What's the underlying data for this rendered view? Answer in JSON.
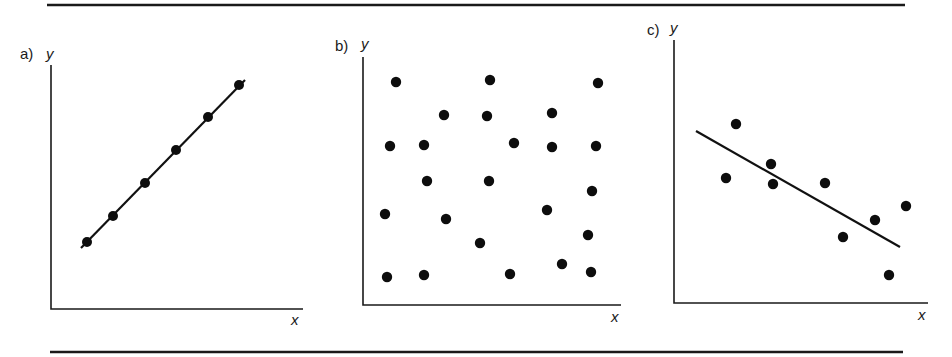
{
  "chart_data": [
    {
      "type": "scatter",
      "panel_label": "a)",
      "xlabel": "x",
      "ylabel": "y",
      "description": "perfect positive linear correlation",
      "points": [
        [
          1,
          1
        ],
        [
          2,
          2
        ],
        [
          3,
          3
        ],
        [
          4,
          4
        ],
        [
          5,
          5
        ],
        [
          6,
          6
        ]
      ],
      "fit_line": {
        "from": [
          0.8,
          0.8
        ],
        "to": [
          6.2,
          6.2
        ]
      },
      "grid": false,
      "ticks": false
    },
    {
      "type": "scatter",
      "panel_label": "b)",
      "xlabel": "x",
      "ylabel": "y",
      "description": "no correlation (random scatter)",
      "points": [
        [
          1.3,
          8.7
        ],
        [
          5.0,
          8.8
        ],
        [
          9.3,
          8.6
        ],
        [
          3.2,
          7.4
        ],
        [
          4.9,
          7.3
        ],
        [
          7.5,
          7.5
        ],
        [
          1.1,
          6.2
        ],
        [
          2.4,
          6.2
        ],
        [
          6.0,
          6.3
        ],
        [
          7.5,
          6.1
        ],
        [
          9.2,
          6.2
        ],
        [
          2.5,
          4.8
        ],
        [
          5.0,
          4.8
        ],
        [
          9.1,
          4.4
        ],
        [
          0.9,
          3.5
        ],
        [
          3.3,
          3.3
        ],
        [
          7.3,
          3.7
        ],
        [
          4.6,
          2.5
        ],
        [
          8.9,
          2.8
        ],
        [
          1.0,
          1.0
        ],
        [
          2.4,
          1.1
        ],
        [
          5.8,
          1.1
        ],
        [
          7.9,
          1.5
        ],
        [
          9.0,
          1.2
        ]
      ],
      "fit_line": null,
      "grid": false,
      "ticks": false
    },
    {
      "type": "scatter",
      "panel_label": "c)",
      "xlabel": "x",
      "ylabel": "y",
      "description": "moderate negative correlation with fitted line",
      "points": [
        [
          2.4,
          6.9
        ],
        [
          2.0,
          4.8
        ],
        [
          3.8,
          5.4
        ],
        [
          3.9,
          4.6
        ],
        [
          5.9,
          4.7
        ],
        [
          6.6,
          2.6
        ],
        [
          7.9,
          3.3
        ],
        [
          9.1,
          3.8
        ],
        [
          8.4,
          1.1
        ]
      ],
      "fit_line": {
        "from": [
          0.9,
          6.6
        ],
        "to": [
          8.9,
          2.1
        ]
      },
      "grid": false,
      "ticks": false
    }
  ],
  "figure": {
    "panels": [
      {
        "id": "a",
        "label": "a)",
        "ylabel": "y",
        "xlabel": "x",
        "axis": {
          "x0": 51,
          "y0": 309,
          "x1": 303,
          "ytop": 65
        },
        "label_pos": {
          "lx": 20,
          "ly": 59,
          "yx": 46,
          "yy": 59,
          "xx": 291,
          "xy": 325
        },
        "pixel_points": [
          [
            87,
            242
          ],
          [
            113,
            216
          ],
          [
            145,
            183
          ],
          [
            176,
            150
          ],
          [
            208,
            117
          ],
          [
            239,
            85
          ]
        ],
        "pixel_line": [
          81,
          248,
          245,
          80
        ]
      },
      {
        "id": "b",
        "label": "b)",
        "ylabel": "y",
        "xlabel": "x",
        "axis": {
          "x0": 363,
          "y0": 305,
          "x1": 621,
          "ytop": 57
        },
        "label_pos": {
          "lx": 335,
          "ly": 51,
          "yx": 361,
          "yy": 49,
          "xx": 611,
          "xy": 322
        },
        "pixel_points": [
          [
            396,
            82
          ],
          [
            490,
            80
          ],
          [
            598,
            83
          ],
          [
            444,
            115
          ],
          [
            487,
            116
          ],
          [
            552,
            113
          ],
          [
            390,
            146
          ],
          [
            424,
            145
          ],
          [
            514,
            143
          ],
          [
            552,
            147
          ],
          [
            596,
            146
          ],
          [
            427,
            181
          ],
          [
            489,
            181
          ],
          [
            592,
            191
          ],
          [
            385,
            214
          ],
          [
            446,
            219
          ],
          [
            547,
            210
          ],
          [
            480,
            243
          ],
          [
            588,
            235
          ],
          [
            387,
            277
          ],
          [
            424,
            275
          ],
          [
            510,
            274
          ],
          [
            562,
            264
          ],
          [
            591,
            272
          ]
        ],
        "pixel_line": null
      },
      {
        "id": "c",
        "label": "c)",
        "ylabel": "y",
        "xlabel": "x",
        "axis": {
          "x0": 674,
          "y0": 303,
          "x1": 928,
          "ytop": 40
        },
        "label_pos": {
          "lx": 647,
          "ly": 35,
          "yx": 670,
          "yy": 33,
          "xx": 918,
          "xy": 320
        },
        "pixel_points": [
          [
            736,
            124
          ],
          [
            726,
            178
          ],
          [
            771,
            164
          ],
          [
            773,
            184
          ],
          [
            825,
            183
          ],
          [
            843,
            237
          ],
          [
            875,
            220
          ],
          [
            906,
            206
          ],
          [
            889,
            275
          ]
        ],
        "pixel_line": [
          696,
          131,
          900,
          247
        ]
      }
    ],
    "rules": [
      {
        "x1": 47,
        "x2": 905,
        "y": 5
      },
      {
        "x1": 50,
        "x2": 903,
        "y": 352
      }
    ],
    "colors": {
      "ink": "#111111",
      "background": "#ffffff"
    }
  }
}
